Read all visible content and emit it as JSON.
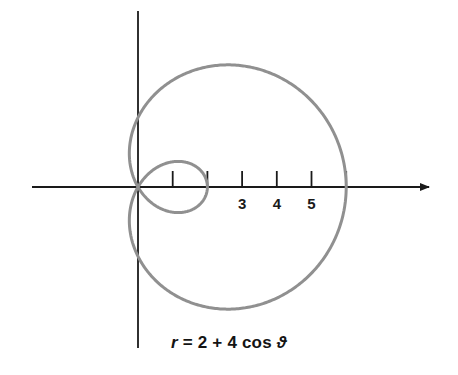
{
  "figure": {
    "name": "polar-limacon-plot",
    "caption": "r = 2 + 4 cos ϑ",
    "caption_parts": {
      "r": "r",
      "equals": " = ",
      "two": "2",
      "plus": " + ",
      "four": "4",
      "cos": " cos ",
      "theta": "ϑ"
    },
    "background_color": "#ffffff",
    "curve_color": "#909090",
    "axis_color": "#1a1a1a",
    "label_color": "#1a1a1a"
  },
  "axes": {
    "x_axis": {
      "name": "x-axis",
      "start_px": 32,
      "end_px": 437,
      "y_px": 187,
      "arrow": "right"
    },
    "y_axis": {
      "name": "y-axis",
      "top_px": 11,
      "bottom_px": 348,
      "x_px": 138,
      "arrow": "none"
    },
    "origin_px": {
      "x": 138,
      "y": 187
    },
    "unit_px": 34.7
  },
  "ticks": [
    {
      "value": 1,
      "x_px": 172.7,
      "label": ""
    },
    {
      "value": 2,
      "x_px": 207.4,
      "label": ""
    },
    {
      "value": 3,
      "x_px": 242.1,
      "label": "3"
    },
    {
      "value": 4,
      "x_px": 276.8,
      "label": "4"
    },
    {
      "value": 5,
      "x_px": 311.5,
      "label": "5"
    },
    {
      "value": 6,
      "x_px": 346.2,
      "label": ""
    }
  ],
  "tick_labels_visible": [
    "3",
    "4",
    "5"
  ],
  "chart_data": {
    "type": "line",
    "subtype": "polar-limacon-with-inner-loop",
    "title": "",
    "equation": "r = 2 + 4 cos ϑ",
    "polar": {
      "a": 2,
      "b": 4,
      "form": "r = a + b cos(theta)",
      "theta_range_deg": [
        0,
        360
      ],
      "r_max": 6,
      "r_at_theta_0": 6,
      "r_at_theta_90": 2,
      "r_at_theta_180": -2,
      "r_at_theta_270": 2,
      "inner_loop_extent": 2,
      "zero_crossings_deg": [
        120,
        240
      ]
    },
    "xlabel": "",
    "ylabel": "",
    "xlim": [
      -3.06,
      8.62
    ],
    "ylim": [
      -5.39,
      4.32
    ],
    "grid": false,
    "legend": false,
    "x_tick_values": [
      1,
      2,
      3,
      4,
      5,
      6
    ],
    "x_tick_labels": [
      "",
      "",
      "3",
      "4",
      "5",
      ""
    ],
    "series": [
      {
        "name": "r = 2 + 4 cos ϑ",
        "color": "#909090",
        "stroke_width": 3,
        "closed": true,
        "sampled_points_polar": [
          {
            "theta_deg": 0,
            "r": 6.0
          },
          {
            "theta_deg": 15,
            "r": 5.864
          },
          {
            "theta_deg": 30,
            "r": 5.464
          },
          {
            "theta_deg": 45,
            "r": 4.828
          },
          {
            "theta_deg": 60,
            "r": 4.0
          },
          {
            "theta_deg": 75,
            "r": 3.035
          },
          {
            "theta_deg": 90,
            "r": 2.0
          },
          {
            "theta_deg": 105,
            "r": 0.965
          },
          {
            "theta_deg": 120,
            "r": 0.0
          },
          {
            "theta_deg": 135,
            "r": -0.828
          },
          {
            "theta_deg": 150,
            "r": -1.464
          },
          {
            "theta_deg": 165,
            "r": -1.864
          },
          {
            "theta_deg": 180,
            "r": -2.0
          },
          {
            "theta_deg": 195,
            "r": -1.864
          },
          {
            "theta_deg": 210,
            "r": -1.464
          },
          {
            "theta_deg": 225,
            "r": -0.828
          },
          {
            "theta_deg": 240,
            "r": 0.0
          },
          {
            "theta_deg": 255,
            "r": 0.965
          },
          {
            "theta_deg": 270,
            "r": 2.0
          },
          {
            "theta_deg": 285,
            "r": 3.035
          },
          {
            "theta_deg": 300,
            "r": 4.0
          },
          {
            "theta_deg": 315,
            "r": 4.828
          },
          {
            "theta_deg": 330,
            "r": 5.464
          },
          {
            "theta_deg": 345,
            "r": 5.864
          },
          {
            "theta_deg": 360,
            "r": 6.0
          }
        ]
      }
    ]
  }
}
